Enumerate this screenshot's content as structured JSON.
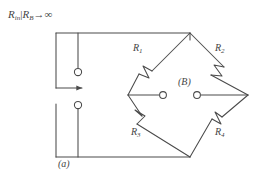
{
  "figure": {
    "type": "circuit-diagram",
    "stroke_color": "#4a4a4a",
    "text_color": "#454545",
    "background_color": "#ffffff"
  },
  "labels": {
    "input_resistance": "R",
    "input_resistance_sub": "in",
    "divider": "|",
    "bridge_resistance": "R",
    "bridge_resistance_sub": "B",
    "arrow_to": "→",
    "infinity": "∞",
    "input_label_full": "R_in | R_B → ∞",
    "part_label": "(a)",
    "bridge_label": "(B)"
  },
  "resistors": [
    {
      "name": "R",
      "sub": "1",
      "position": "upper-left",
      "kind": "variable"
    },
    {
      "name": "R",
      "sub": "2",
      "position": "upper-right",
      "kind": "variable"
    },
    {
      "name": "R",
      "sub": "3",
      "position": "lower-left",
      "kind": "variable"
    },
    {
      "name": "R",
      "sub": "4",
      "position": "lower-right",
      "kind": "variable"
    }
  ],
  "nodes": {
    "bridge_top": [
      190,
      33
    ],
    "bridge_left": [
      128,
      95
    ],
    "bridge_right": [
      248,
      95
    ],
    "bridge_bottom": [
      190,
      157
    ],
    "terminal_bridge_left": [
      163,
      95
    ],
    "terminal_bridge_right": [
      197,
      95
    ],
    "terminal_input_top": [
      78,
      72
    ],
    "terminal_input_bottom": [
      78,
      105
    ]
  },
  "wires": {
    "top_rail": "from (56,33) right to (190,33) down to bridge top",
    "bottom_rail": "from (56,157) right to (190,157) up to bridge bottom",
    "input_arrow": "from (56,88) right to (84,88) arrowhead"
  }
}
